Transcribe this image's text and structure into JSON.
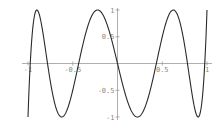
{
  "chart_data": {
    "type": "line",
    "title": "",
    "xlabel": "",
    "ylabel": "",
    "xlim": [
      -1,
      1
    ],
    "ylim": [
      -1,
      1
    ],
    "grid": false,
    "legend": null,
    "x_ticks": [
      {
        "value": -1,
        "label": "-1"
      },
      {
        "value": -0.5,
        "label": "-0.5"
      },
      {
        "value": 0.5,
        "label": "0.5"
      },
      {
        "value": 1,
        "label": "1"
      }
    ],
    "y_ticks": [
      {
        "value": 1,
        "label": "1"
      },
      {
        "value": 0.5,
        "label": "0.5"
      },
      {
        "value": -0.5,
        "label": "-0.5"
      },
      {
        "value": -1,
        "label": "-1"
      }
    ],
    "series": [
      {
        "name": "T7(x) = cos(7 arccos x)",
        "color": "#2a2a2a",
        "x": [
          -1,
          -0.975,
          -0.9,
          -0.782,
          -0.623,
          -0.434,
          -0.223,
          0,
          0.223,
          0.434,
          0.623,
          0.782,
          0.9,
          0.975,
          1
        ],
        "y": [
          -1,
          0,
          1,
          0,
          -1,
          0,
          1,
          0,
          -1,
          0,
          1,
          0,
          -1,
          0,
          1
        ]
      }
    ],
    "extrema": {
      "maxima_x": [
        -0.901,
        -0.223,
        0.623
      ],
      "minima_x": [
        -0.623,
        0.223,
        0.901
      ],
      "zeros_x": [
        -0.975,
        -0.782,
        -0.434,
        0,
        0.434,
        0.782,
        0.975
      ]
    }
  },
  "colors": {
    "axis": "#9a9a9a",
    "tick_label": "#8a8a8a",
    "curve": "#2a2a2a",
    "background": "#ffffff"
  }
}
